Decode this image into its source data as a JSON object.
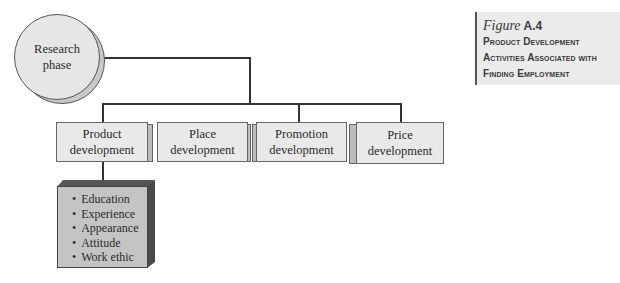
{
  "figure": {
    "label": "Figure",
    "number": "A.4",
    "title_lines": [
      "Product Development",
      "Activities Associated with",
      "Finding Employment"
    ]
  },
  "root": {
    "line1": "Research",
    "line2": "phase"
  },
  "nodes": [
    {
      "line1": "Product",
      "line2": "development"
    },
    {
      "line1": "Place",
      "line2": "development"
    },
    {
      "line1": "Promotion",
      "line2": "development"
    },
    {
      "line1": "Price",
      "line2": "development"
    }
  ],
  "product_items": [
    "Education",
    "Experience",
    "Appearance",
    "Attitude",
    "Work ethic"
  ],
  "colors": {
    "line": "#333333",
    "box_fill": "#e9e9e9",
    "list_fill": "#c4c4c4",
    "caption_bg": "#ebebeb"
  }
}
